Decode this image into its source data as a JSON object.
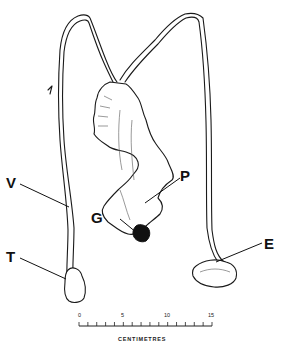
{
  "figure": {
    "labels": {
      "V": "V",
      "P": "P",
      "G": "G",
      "T": "T",
      "E": "E"
    },
    "scale_bar": {
      "tick_labels": [
        "0",
        "5",
        "10",
        "15"
      ],
      "unit": "CENTIMETRES",
      "min": 0,
      "max": 15,
      "minor_step": 1
    }
  }
}
